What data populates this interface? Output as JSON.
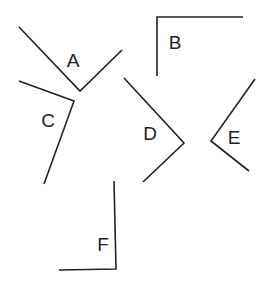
{
  "figure": {
    "stroke_color": "#222222",
    "angles": [
      {
        "label": "A",
        "points": [
          [
            19,
            27
          ],
          [
            80,
            91
          ],
          [
            122,
            50
          ]
        ],
        "label_pos": [
          73,
          60
        ]
      },
      {
        "label": "B",
        "points": [
          [
            157,
            76
          ],
          [
            157,
            17
          ],
          [
            243,
            17
          ]
        ],
        "label_pos": [
          175,
          42
        ]
      },
      {
        "label": "C",
        "points": [
          [
            19,
            81
          ],
          [
            74,
            101
          ],
          [
            44,
            184
          ]
        ],
        "label_pos": [
          48,
          120
        ]
      },
      {
        "label": "D",
        "points": [
          [
            124,
            78
          ],
          [
            184,
            143
          ],
          [
            143,
            182
          ]
        ],
        "label_pos": [
          150,
          133
        ]
      },
      {
        "label": "E",
        "points": [
          [
            255,
            79
          ],
          [
            211,
            141
          ],
          [
            249,
            171
          ]
        ],
        "label_pos": [
          234,
          137
        ]
      },
      {
        "label": "F",
        "points": [
          [
            114,
            181
          ],
          [
            116,
            269
          ],
          [
            59,
            270
          ]
        ],
        "label_pos": [
          103,
          244
        ]
      }
    ]
  }
}
